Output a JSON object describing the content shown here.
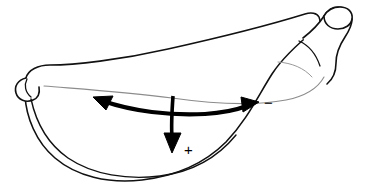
{
  "figure": {
    "name": "banana-curvature-diagram",
    "background_color": "#ffffff",
    "outline_color": "#111111",
    "inner_line_color": "#8c8c8c",
    "annotation_color": "#000000",
    "width": 374,
    "height": 185
  },
  "annotations": {
    "negative_sign": "−",
    "positive_sign": "+",
    "negative_label_name": "negative-direction-label",
    "positive_label_name": "positive-direction-label",
    "arc_arrow_name": "bidirectional-arc-arrow",
    "down_arrow_name": "downward-arrow"
  },
  "parts": {
    "body": "banana-body",
    "stem": "banana-stem",
    "stem_cut": "banana-stem-cut-ellipse",
    "tip": "banana-blossom-tip",
    "ridge": "banana-ridge-line",
    "inner_seam": "banana-inner-seam-line"
  }
}
